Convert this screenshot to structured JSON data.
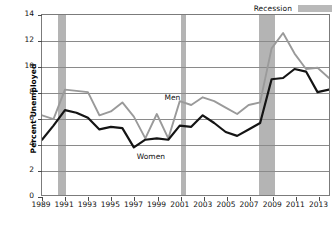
{
  "legend": {
    "items": [
      {
        "label": "Recession",
        "color": "#b4b4b4",
        "type": "band"
      }
    ]
  },
  "axes": {
    "ylabel": "Percent Unemployed",
    "xlabel": "",
    "ylim": [
      0,
      14
    ],
    "xlim": [
      1989,
      2014
    ],
    "yticks": [
      0,
      2,
      4,
      6,
      8,
      10,
      12,
      14
    ],
    "xticks": [
      1989,
      1991,
      1993,
      1995,
      1997,
      1999,
      2001,
      2003,
      2005,
      2007,
      2009,
      2011,
      2013
    ],
    "grid": "horizontal"
  },
  "annotations": [
    {
      "text": "Men",
      "x": 1999.6,
      "y": 7.6
    },
    {
      "text": "Women",
      "x": 1997.2,
      "y": 3.1
    }
  ],
  "chart_data": {
    "type": "line",
    "title": "",
    "subtitle": "",
    "xlabel": "",
    "ylabel": "Percent Unemployed",
    "xlim": [
      1989,
      2014
    ],
    "ylim": [
      0,
      14
    ],
    "grid": "horizontal",
    "legend_position": "top-right",
    "x": [
      1989,
      1990,
      1991,
      1992,
      1993,
      1994,
      1995,
      1996,
      1997,
      1998,
      1999,
      2000,
      2001,
      2002,
      2003,
      2004,
      2005,
      2006,
      2007,
      2008,
      2009,
      2010,
      2011,
      2012,
      2013,
      2014
    ],
    "series": [
      {
        "name": "Men",
        "color": "#9a9a9a",
        "values": [
          6.2,
          5.9,
          8.2,
          8.1,
          8.0,
          6.2,
          6.5,
          7.2,
          6.1,
          4.4,
          6.3,
          4.4,
          7.3,
          7.0,
          7.6,
          7.3,
          6.8,
          6.3,
          7.0,
          7.2,
          11.4,
          12.6,
          11.0,
          9.8,
          9.9,
          9.1
        ]
      },
      {
        "name": "Women",
        "color": "#141414",
        "values": [
          4.3,
          5.4,
          6.6,
          6.4,
          6.0,
          5.1,
          5.3,
          5.2,
          3.7,
          4.3,
          4.4,
          4.3,
          5.4,
          5.3,
          6.2,
          5.6,
          4.9,
          4.6,
          5.1,
          5.6,
          9.0,
          9.1,
          9.8,
          9.6,
          8.0,
          8.2
        ]
      }
    ],
    "bands": [
      {
        "label": "Recession",
        "start": 1990.4,
        "end": 1991.1
      },
      {
        "label": "Recession",
        "start": 2001.0,
        "end": 2001.5
      },
      {
        "label": "Recession",
        "start": 2007.8,
        "end": 2009.2
      }
    ]
  }
}
